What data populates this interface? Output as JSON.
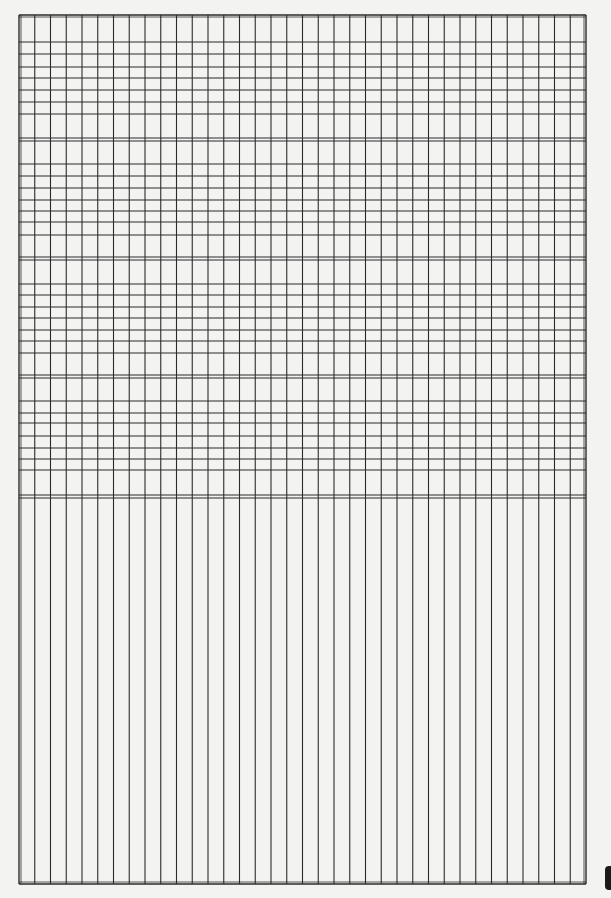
{
  "document": {
    "type": "graph-paper-sheet",
    "paper_color": "#f3f3f2",
    "line_color": "#2b2b2b",
    "frame": {
      "left": 19,
      "right": 586,
      "top": 15,
      "bottom": 884
    },
    "columns": 36,
    "bands": [
      {
        "name": "band-1",
        "top": 15,
        "bottom": 138,
        "rows_y": [
          42,
          54,
          67,
          78,
          90,
          102,
          114
        ]
      },
      {
        "name": "band-2",
        "top": 141,
        "bottom": 257,
        "rows_y": [
          164,
          176,
          188,
          200,
          211,
          222,
          235
        ]
      },
      {
        "name": "band-3",
        "top": 260,
        "bottom": 375,
        "rows_y": [
          284,
          295,
          307,
          318,
          330,
          341,
          353
        ]
      },
      {
        "name": "band-4",
        "top": 378,
        "bottom": 495,
        "rows_y": [
          401,
          413,
          423,
          436,
          448,
          459,
          470
        ]
      }
    ],
    "double_rule_y": [
      [
        138,
        141
      ],
      [
        257,
        260
      ],
      [
        375,
        378
      ],
      [
        495,
        498
      ]
    ],
    "lower_section": {
      "top": 498,
      "bottom": 884,
      "horizontal_lines": 0
    }
  }
}
